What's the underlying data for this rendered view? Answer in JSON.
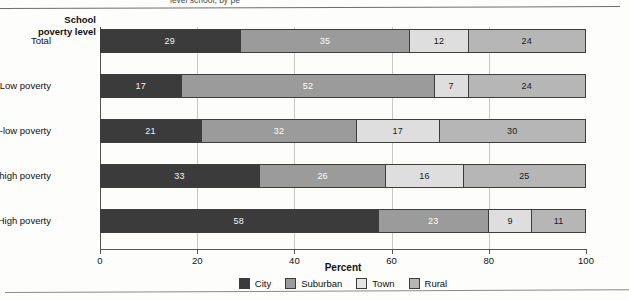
{
  "page": {
    "clipped_header_text": "level school, by pe",
    "background_color": "#fdfdfc"
  },
  "chart_data": {
    "type": "bar",
    "orientation": "horizontal",
    "stacked": true,
    "stacked_normalized": true,
    "title": "",
    "xlabel": "Percent",
    "ylabel": "School poverty level",
    "xlim": [
      0,
      100
    ],
    "xticks": [
      0,
      20,
      40,
      60,
      80,
      100
    ],
    "xtick_labels": [
      "0",
      "20",
      "40",
      "60",
      "80",
      "100"
    ],
    "grid": "vertical",
    "legend_position": "bottom-center",
    "categories": [
      "Total",
      "Low poverty",
      "Mid-low poverty",
      "Mid-high poverty",
      "High poverty"
    ],
    "series": [
      {
        "name": "City",
        "color": "#3b3b3b",
        "values": [
          29,
          17,
          21,
          33,
          58
        ]
      },
      {
        "name": "Suburban",
        "color": "#9b9b9b",
        "values": [
          35,
          52,
          32,
          26,
          23
        ]
      },
      {
        "name": "Town",
        "color": "#dedede",
        "values": [
          12,
          7,
          17,
          16,
          9
        ]
      },
      {
        "name": "Rural",
        "color": "#b6b6b6",
        "values": [
          24,
          24,
          30,
          25,
          11
        ]
      }
    ]
  },
  "colors": {
    "city": "#3b3b3b",
    "suburban": "#9b9b9b",
    "town": "#dedede",
    "rural": "#b6b6b6",
    "axis": "#555555",
    "gridline": "#c9c9c9"
  }
}
